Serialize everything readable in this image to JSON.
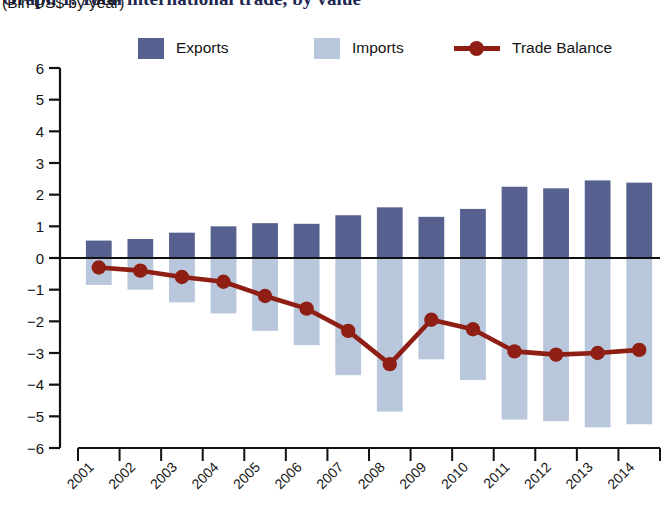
{
  "title": "Graph 1. Total international trade, by value",
  "subtitle": "(Bln US$ by year)",
  "legend": {
    "exports_label": "Exports",
    "imports_label": "Imports",
    "balance_label": "Trade Balance"
  },
  "colors": {
    "exports": "#56618f",
    "imports": "#b9c7dc",
    "balance": "#8f1f14",
    "axis": "#111111",
    "text": "#141414",
    "title": "#20264f"
  },
  "chart_data": {
    "type": "bar",
    "title": "Graph 1. Total international trade, by value",
    "subtitle": "(Bln US$ by year)",
    "xlabel": "",
    "ylabel": "(Bln US$ by year)",
    "ylim": [
      -6,
      6
    ],
    "ytick_step": 1,
    "yticks": [
      6,
      5,
      4,
      3,
      2,
      1,
      0,
      -1,
      -2,
      -3,
      -4,
      -5,
      -6
    ],
    "ytick_labels": [
      "6",
      "5",
      "4",
      "3",
      "2",
      "1",
      "0",
      "−1",
      "−2",
      "−3",
      "−4",
      "−5",
      "−6"
    ],
    "grid": false,
    "legend_position": "top",
    "categories": [
      "2001",
      "2002",
      "2003",
      "2004",
      "2005",
      "2006",
      "2007",
      "2008",
      "2009",
      "2010",
      "2011",
      "2012",
      "2013",
      "2014"
    ],
    "series": [
      {
        "name": "Exports",
        "type": "bar",
        "color": "#56618f",
        "values": [
          0.55,
          0.6,
          0.8,
          1.0,
          1.1,
          1.08,
          1.35,
          1.6,
          1.3,
          1.55,
          2.25,
          2.2,
          2.45,
          2.38
        ]
      },
      {
        "name": "Imports",
        "type": "bar",
        "color": "#b9c7dc",
        "values": [
          -0.85,
          -1.0,
          -1.4,
          -1.75,
          -2.3,
          -2.75,
          -3.7,
          -4.85,
          -3.2,
          -3.85,
          -5.1,
          -5.15,
          -5.35,
          -5.25
        ]
      },
      {
        "name": "Trade Balance",
        "type": "line",
        "color": "#8f1f14",
        "values": [
          -0.3,
          -0.4,
          -0.6,
          -0.75,
          -1.2,
          -1.6,
          -2.3,
          -3.35,
          -1.95,
          -2.25,
          -2.95,
          -3.05,
          -3.0,
          -2.9
        ]
      }
    ]
  }
}
